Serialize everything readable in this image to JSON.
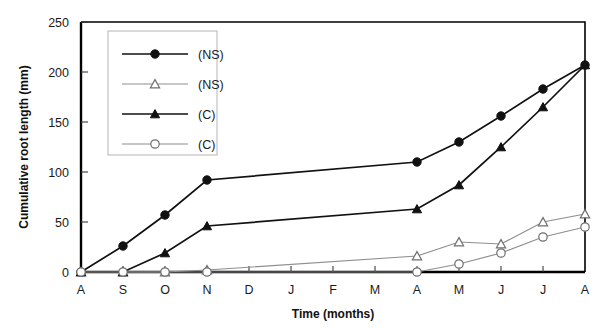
{
  "chart_data": {
    "type": "line",
    "title": "",
    "xlabel": "Time (months)",
    "ylabel": "Cumulative root length (mm)",
    "categories": [
      "A",
      "S",
      "O",
      "N",
      "D",
      "J",
      "F",
      "M",
      "A",
      "M",
      "J",
      "J",
      "A"
    ],
    "x_tick_labels": [
      "A",
      "S",
      "O",
      "N",
      "D",
      "J",
      "F",
      "M",
      "A",
      "M",
      "J",
      "J",
      "A"
    ],
    "y_tick_labels": [
      "0",
      "50",
      "100",
      "150",
      "200",
      "250"
    ],
    "y_ticks": [
      0,
      50,
      100,
      150,
      200,
      250
    ],
    "ylim": [
      0,
      250
    ],
    "grid": false,
    "legend_position": "upper-left-inside",
    "series": [
      {
        "name": "(NS)",
        "marker": "filled-circle",
        "line_color": "#111111",
        "values": [
          0,
          26,
          57,
          92,
          null,
          null,
          null,
          null,
          110,
          130,
          156,
          183,
          207
        ],
        "x": [
          "A",
          "S",
          "O",
          "N",
          "D",
          "J",
          "F",
          "M",
          "A",
          "M",
          "J",
          "J",
          "A"
        ]
      },
      {
        "name": "(NS)",
        "marker": "open-triangle",
        "line_color": "#8e8e8e",
        "values": [
          0,
          0,
          0,
          2,
          null,
          null,
          null,
          null,
          16,
          30,
          28,
          50,
          58
        ],
        "x": [
          "A",
          "S",
          "O",
          "N",
          "D",
          "J",
          "F",
          "M",
          "A",
          "M",
          "J",
          "J",
          "A"
        ]
      },
      {
        "name": "(C)",
        "marker": "filled-triangle",
        "line_color": "#111111",
        "values": [
          0,
          0,
          19,
          46,
          null,
          null,
          null,
          null,
          63,
          87,
          125,
          165,
          207
        ],
        "x": [
          "A",
          "S",
          "O",
          "N",
          "D",
          "J",
          "F",
          "M",
          "A",
          "M",
          "J",
          "J",
          "A"
        ]
      },
      {
        "name": "(C)",
        "marker": "open-circle",
        "line_color": "#8e8e8e",
        "values": [
          0,
          0,
          0,
          0,
          null,
          null,
          null,
          null,
          0,
          8,
          19,
          35,
          45
        ],
        "x": [
          "A",
          "S",
          "O",
          "N",
          "D",
          "J",
          "F",
          "M",
          "A",
          "M",
          "J",
          "J",
          "A"
        ]
      }
    ],
    "legend_entries": [
      {
        "label": "(NS)",
        "marker": "filled-circle",
        "color": "#111111"
      },
      {
        "label": "(NS)",
        "marker": "open-triangle",
        "color": "#8e8e8e"
      },
      {
        "label": "(C)",
        "marker": "filled-triangle",
        "color": "#111111"
      },
      {
        "label": "(C)",
        "marker": "open-circle",
        "color": "#8e8e8e"
      }
    ]
  }
}
